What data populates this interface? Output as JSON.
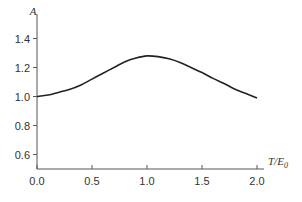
{
  "chart_data": {
    "type": "line",
    "title": "",
    "xlabel": "T/E0",
    "xlabel_main": "T/E",
    "xlabel_sub": "0",
    "ylabel": "A",
    "xlim": [
      0.0,
      2.0
    ],
    "ylim": [
      0.5,
      1.5
    ],
    "x_ticks": [
      "0.0",
      "0.5",
      "1.0",
      "1.5",
      "2.0"
    ],
    "y_ticks": [
      "0.6",
      "0.8",
      "1.0",
      "1.2",
      "1.4"
    ],
    "grid": false,
    "legend": null,
    "series": [
      {
        "name": "A",
        "x": [
          0.0,
          0.1,
          0.2,
          0.3,
          0.4,
          0.5,
          0.6,
          0.7,
          0.8,
          0.9,
          1.0,
          1.1,
          1.2,
          1.3,
          1.4,
          1.5,
          1.6,
          1.7,
          1.8,
          1.9,
          2.0
        ],
        "values": [
          1.0,
          1.01,
          1.03,
          1.05,
          1.08,
          1.12,
          1.16,
          1.2,
          1.24,
          1.265,
          1.28,
          1.275,
          1.26,
          1.235,
          1.2,
          1.165,
          1.125,
          1.09,
          1.05,
          1.02,
          0.99
        ]
      }
    ]
  }
}
